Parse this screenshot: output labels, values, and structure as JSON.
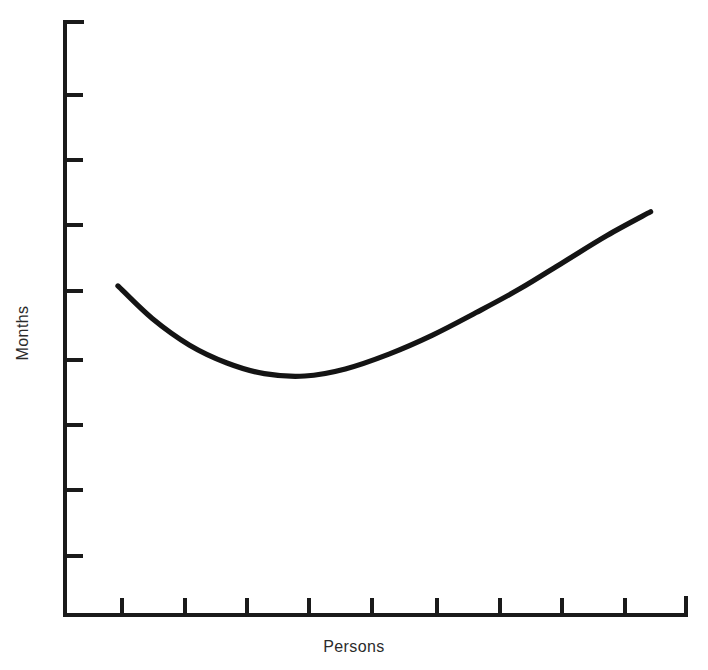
{
  "chart_data": {
    "type": "line",
    "title": "",
    "subtitle": "",
    "xlabel": "Persons",
    "ylabel": "Months",
    "grid": false,
    "legend": "none",
    "axis_style": "open L-shaped axes with end caps, unlabeled ticks",
    "x_tick_count": 9,
    "y_tick_count": 9,
    "x_tick_labels": [
      "",
      "",
      "",
      "",
      "",
      "",
      "",
      "",
      ""
    ],
    "y_tick_labels": [
      "",
      "",
      "",
      "",
      "",
      "",
      "",
      "",
      ""
    ],
    "xlim": [
      0,
      10
    ],
    "ylim": [
      0,
      10
    ],
    "series": [
      {
        "name": "Schedule time vs. team size",
        "x": [
          0.85,
          1.4,
          2.0,
          2.6,
          3.2,
          3.85,
          4.5,
          5.2,
          5.9,
          6.6,
          7.3,
          8.0,
          8.7,
          9.4
        ],
        "y": [
          5.55,
          5.0,
          4.55,
          4.25,
          4.07,
          4.03,
          4.15,
          4.4,
          4.72,
          5.1,
          5.5,
          5.95,
          6.4,
          6.8
        ]
      }
    ],
    "annotations": [],
    "minimum_point": {
      "x": 3.85,
      "y": 4.03
    },
    "start_point": {
      "x": 0.85,
      "y": 5.55
    },
    "end_point": {
      "x": 9.4,
      "y": 6.8
    }
  },
  "colors": {
    "curve": "#141414",
    "axis": "#1a1a1a",
    "label_text": "#2b2b2b",
    "background": "#ffffff"
  },
  "labels": {
    "x_axis": "Persons",
    "y_axis": "Months"
  }
}
